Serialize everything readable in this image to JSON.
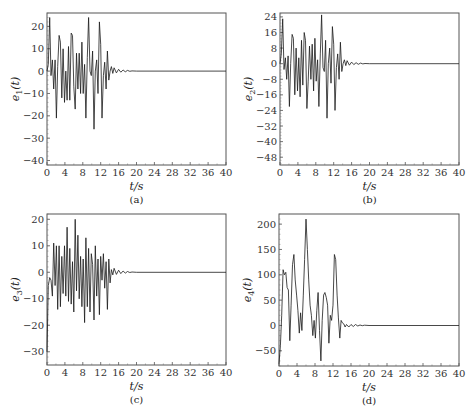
{
  "chart_data": [
    {
      "id": "a",
      "type": "line",
      "caption": "(a)",
      "xlabel": "t/s",
      "ylabel": "e1(t)",
      "ylabel_main": "e",
      "ylabel_sub": "1",
      "xlim": [
        0,
        40
      ],
      "ylim": [
        -42,
        26
      ],
      "xticks": [
        0,
        4,
        8,
        12,
        16,
        20,
        24,
        28,
        32,
        36,
        40
      ],
      "yticks": [
        20,
        10,
        0,
        -10,
        -20,
        -30,
        -40
      ],
      "grid": false,
      "frame": {
        "left": 47,
        "top": 13,
        "right": 226,
        "bottom": 165
      },
      "series": [
        {
          "name": "e1",
          "x": [
            0,
            0.3,
            0.6,
            0.9,
            1.2,
            1.5,
            1.8,
            2.1,
            2.4,
            2.7,
            3.0,
            3.3,
            3.6,
            3.9,
            4.2,
            4.5,
            4.8,
            5.1,
            5.4,
            5.7,
            6.0,
            6.3,
            6.6,
            6.9,
            7.2,
            7.5,
            7.8,
            8.1,
            8.4,
            8.7,
            9.0,
            9.3,
            9.6,
            9.9,
            10.2,
            10.5,
            10.8,
            11.1,
            11.4,
            11.7,
            12.0,
            12.3,
            12.6,
            12.9,
            13.2,
            13.5,
            13.8,
            14.1,
            14.4,
            14.7,
            15.0,
            15.5,
            16.0,
            16.5,
            17.0,
            17.5,
            18.0,
            18.5,
            19.0,
            20,
            40
          ],
          "y": [
            0,
            3,
            24,
            -2,
            5,
            -8,
            5,
            -21,
            2,
            16,
            13,
            -12,
            10,
            -14,
            0,
            -13,
            11,
            -13,
            17,
            16,
            -7,
            -17,
            8,
            -8,
            8,
            -10,
            13,
            -10,
            3,
            -21,
            6,
            24,
            0,
            -2,
            9,
            -26,
            0,
            5,
            -10,
            22,
            12,
            -21,
            -2,
            4,
            -8,
            9,
            -4,
            0,
            2,
            -1,
            1.5,
            -0.8,
            0.8,
            -0.5,
            0.5,
            -0.3,
            0.3,
            -0.1,
            0.1,
            0,
            0
          ]
        }
      ]
    },
    {
      "id": "b",
      "type": "line",
      "caption": "(b)",
      "xlabel": "t/s",
      "ylabel": "e2(t)",
      "ylabel_main": "e",
      "ylabel_sub": "2",
      "xlim": [
        0,
        40
      ],
      "ylim": [
        -52,
        26
      ],
      "xticks": [
        0,
        4,
        8,
        12,
        16,
        20,
        24,
        28,
        32,
        36,
        40
      ],
      "yticks": [
        24,
        16,
        8,
        0,
        -8,
        -16,
        -24,
        -32,
        -40,
        -48
      ],
      "grid": false,
      "frame": {
        "left": 280,
        "top": 13,
        "right": 459,
        "bottom": 165
      },
      "series": [
        {
          "name": "e2",
          "x": [
            0,
            0.3,
            0.6,
            0.9,
            1.2,
            1.5,
            1.8,
            2.1,
            2.4,
            2.7,
            3.0,
            3.3,
            3.6,
            3.9,
            4.2,
            4.5,
            4.8,
            5.1,
            5.4,
            5.7,
            6.0,
            6.3,
            6.6,
            6.9,
            7.2,
            7.5,
            7.8,
            8.1,
            8.4,
            8.7,
            9.0,
            9.3,
            9.6,
            9.9,
            10.2,
            10.5,
            10.8,
            11.1,
            11.4,
            11.7,
            12.0,
            12.3,
            12.6,
            12.9,
            13.2,
            13.5,
            13.8,
            14.1,
            14.4,
            14.7,
            15.0,
            15.5,
            16.0,
            16.5,
            17.0,
            17.5,
            18.0,
            18.5,
            19.0,
            20,
            40
          ],
          "y": [
            0,
            5,
            23,
            -3,
            3,
            -8,
            4,
            -22,
            0,
            15,
            13,
            -16,
            8,
            -14,
            3,
            -17,
            12,
            -11,
            16,
            12,
            -23,
            -9,
            9,
            -8,
            10,
            -14,
            13,
            -9,
            2,
            -22,
            5,
            25,
            -2,
            -4,
            12,
            -28,
            0,
            8,
            -10,
            19,
            10,
            -24,
            -2,
            5,
            -8,
            11,
            -4,
            0,
            2,
            -1,
            1.5,
            -0.8,
            0.8,
            -0.5,
            0.5,
            -0.3,
            0.3,
            -0.1,
            0.1,
            0,
            0
          ]
        }
      ]
    },
    {
      "id": "c",
      "type": "line",
      "caption": "(c)",
      "xlabel": "t/s",
      "ylabel": "e3(t)",
      "ylabel_main": "e",
      "ylabel_sub": "3",
      "xlim": [
        0,
        40
      ],
      "ylim": [
        -35,
        22
      ],
      "xticks": [
        0,
        4,
        8,
        12,
        16,
        20,
        24,
        28,
        32,
        36,
        40
      ],
      "yticks": [
        20,
        10,
        0,
        -10,
        -20,
        -30
      ],
      "grid": false,
      "frame": {
        "left": 47,
        "top": 214,
        "right": 226,
        "bottom": 365
      },
      "series": [
        {
          "name": "e3",
          "x": [
            0,
            0.3,
            0.6,
            0.9,
            1.2,
            1.5,
            1.8,
            2.1,
            2.4,
            2.7,
            3.0,
            3.3,
            3.6,
            3.9,
            4.2,
            4.5,
            4.8,
            5.1,
            5.4,
            5.7,
            6.0,
            6.3,
            6.6,
            6.9,
            7.2,
            7.5,
            7.8,
            8.1,
            8.4,
            8.7,
            9.0,
            9.3,
            9.6,
            9.9,
            10.2,
            10.5,
            10.8,
            11.1,
            11.4,
            11.7,
            12.0,
            12.3,
            12.6,
            12.9,
            13.2,
            13.5,
            13.8,
            14.1,
            14.4,
            14.7,
            15.0,
            15.5,
            16.0,
            16.5,
            17.0,
            17.5,
            18.0,
            18.5,
            19.0,
            20,
            40
          ],
          "y": [
            -30,
            -5,
            -2,
            -3,
            -9,
            11,
            -5,
            10,
            -14,
            10,
            -13,
            6,
            -8,
            10,
            -9,
            17,
            -11,
            9,
            -12,
            4,
            -15,
            20,
            -7,
            14,
            -10,
            6,
            -13,
            5,
            -19,
            13,
            -13,
            9,
            -15,
            7,
            3,
            -18,
            10,
            -9,
            5,
            -16,
            6,
            -3,
            7,
            -6,
            4,
            -14,
            5,
            -4,
            1,
            -1,
            1.5,
            -0.8,
            0.8,
            -0.5,
            0.5,
            -0.3,
            0.3,
            -0.1,
            0.1,
            0,
            0
          ]
        }
      ]
    },
    {
      "id": "d",
      "type": "line",
      "caption": "(d)",
      "xlabel": "t/s",
      "ylabel": "e4(t)",
      "ylabel_main": "e",
      "ylabel_sub": "4",
      "xlim": [
        0,
        40
      ],
      "ylim": [
        -80,
        220
      ],
      "xticks": [
        0,
        4,
        8,
        12,
        16,
        20,
        24,
        28,
        32,
        36,
        40
      ],
      "yticks": [
        200,
        150,
        100,
        50,
        0,
        -50
      ],
      "grid": false,
      "frame": {
        "left": 279,
        "top": 214,
        "right": 459,
        "bottom": 366
      },
      "series": [
        {
          "name": "e4",
          "x": [
            0,
            0.3,
            0.6,
            0.9,
            1.2,
            1.5,
            1.8,
            2.1,
            2.4,
            2.7,
            3.0,
            3.3,
            3.6,
            3.9,
            4.2,
            4.5,
            4.8,
            5.1,
            5.4,
            5.7,
            6.0,
            6.3,
            6.6,
            6.9,
            7.2,
            7.5,
            7.8,
            8.1,
            8.4,
            8.7,
            9.0,
            9.3,
            9.6,
            9.9,
            10.2,
            10.5,
            10.8,
            11.1,
            11.4,
            11.7,
            12.0,
            12.3,
            12.6,
            12.9,
            13.2,
            13.5,
            13.8,
            14.1,
            14.4,
            14.7,
            15.0,
            15.5,
            16.0,
            16.5,
            17.0,
            17.5,
            18.0,
            18.5,
            19.0,
            20,
            40
          ],
          "y": [
            -75,
            -40,
            20,
            110,
            100,
            105,
            75,
            70,
            -30,
            40,
            120,
            140,
            90,
            60,
            30,
            -15,
            25,
            -10,
            60,
            130,
            210,
            150,
            90,
            40,
            20,
            -20,
            10,
            -25,
            30,
            65,
            -10,
            -70,
            10,
            60,
            65,
            55,
            40,
            -35,
            20,
            10,
            40,
            140,
            130,
            60,
            15,
            -25,
            10,
            5,
            3,
            -3,
            2,
            -3,
            2,
            -2,
            2,
            -1,
            1,
            -0.5,
            0.5,
            0,
            0
          ]
        }
      ]
    }
  ]
}
